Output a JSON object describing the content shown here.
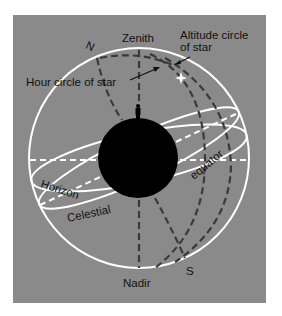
{
  "diagram": {
    "labels": {
      "zenith": "Zenith",
      "nadir": "Nadir",
      "north": "N",
      "south": "S",
      "altitude_circle_line1": "Altitude circle",
      "altitude_circle_line2": "of star",
      "hour_circle": "Hour circle of star",
      "horizon": "Horizon",
      "celestial": "Celestial",
      "equator": "equator"
    },
    "colors": {
      "background": "#8a8a8a",
      "sphere_lines": "#ffffff",
      "dashed_arcs": "#3a3a3a",
      "earth": "#000000",
      "text": "#111111",
      "star": "#ffffff"
    }
  }
}
